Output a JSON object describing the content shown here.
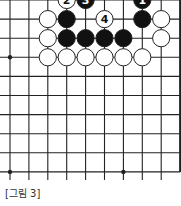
{
  "diagram": {
    "type": "go-board-fragment",
    "caption": "[그림 3]",
    "colors": {
      "line": "#222222",
      "black_stone": "#111111",
      "white_stone": "#ffffff",
      "background": "#ffffff"
    },
    "visible_columns": 10,
    "visible_rows": 10,
    "right_edge_is_board_edge": true,
    "star_points": [
      {
        "col": 0,
        "row": 3
      },
      {
        "col": 0,
        "row": 9
      },
      {
        "col": 6,
        "row": 9
      }
    ],
    "stones": [
      {
        "col": 3,
        "row": 0,
        "color": "white",
        "label": "2"
      },
      {
        "col": 4,
        "row": 0,
        "color": "black",
        "label": "3"
      },
      {
        "col": 7,
        "row": 0,
        "color": "black",
        "label": "1"
      },
      {
        "col": 2,
        "row": 1,
        "color": "white",
        "label": ""
      },
      {
        "col": 3,
        "row": 1,
        "color": "black",
        "label": ""
      },
      {
        "col": 5,
        "row": 1,
        "color": "white",
        "label": "4"
      },
      {
        "col": 7,
        "row": 1,
        "color": "black",
        "label": ""
      },
      {
        "col": 8,
        "row": 1,
        "color": "white",
        "label": ""
      },
      {
        "col": 2,
        "row": 2,
        "color": "white",
        "label": ""
      },
      {
        "col": 3,
        "row": 2,
        "color": "black",
        "label": ""
      },
      {
        "col": 4,
        "row": 2,
        "color": "black",
        "label": ""
      },
      {
        "col": 5,
        "row": 2,
        "color": "black",
        "label": ""
      },
      {
        "col": 6,
        "row": 2,
        "color": "black",
        "label": ""
      },
      {
        "col": 8,
        "row": 2,
        "color": "white",
        "label": ""
      },
      {
        "col": 2,
        "row": 3,
        "color": "white",
        "label": ""
      },
      {
        "col": 3,
        "row": 3,
        "color": "white",
        "label": ""
      },
      {
        "col": 4,
        "row": 3,
        "color": "white",
        "label": ""
      },
      {
        "col": 5,
        "row": 3,
        "color": "white",
        "label": ""
      },
      {
        "col": 6,
        "row": 3,
        "color": "white",
        "label": ""
      },
      {
        "col": 7,
        "row": 3,
        "color": "white",
        "label": ""
      }
    ]
  }
}
